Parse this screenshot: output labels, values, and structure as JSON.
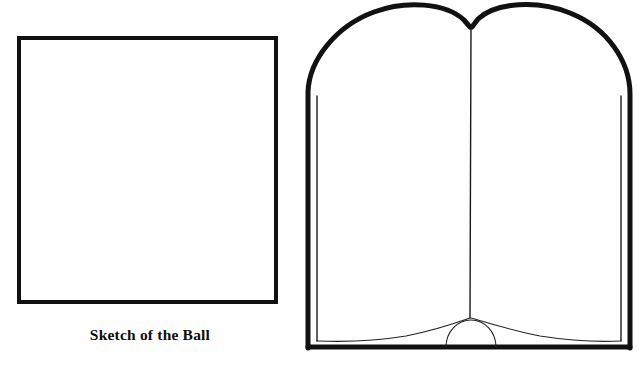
{
  "page": {
    "background_color": "#ffffff",
    "ink_color": "#111111",
    "width": 637,
    "height": 371
  },
  "sketch_figure": {
    "name": "sketch-box",
    "caption": "Sketch of the Ball",
    "box": {
      "content": "",
      "border_color": "#111111",
      "fill_color": "#ffffff"
    }
  },
  "book_figure": {
    "name": "open-book-illustration",
    "caption": "",
    "left_page_label": "",
    "right_page_label": "",
    "stroke_color": "#111111"
  }
}
